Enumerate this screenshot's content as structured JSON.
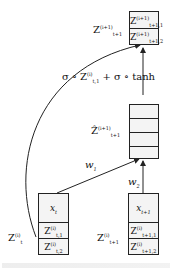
{
  "diagram": {
    "top_node": {
      "label": "Z",
      "label_sup": "(i+1)",
      "label_sub": "t+1",
      "cells": [
        {
          "main": "Z",
          "sup": "(i+1)",
          "sub": "t+1,1"
        },
        {
          "main": "Z",
          "sup": "(i+1)",
          "sub": "t+1,2"
        }
      ]
    },
    "gate_formula": {
      "part1": "σ ∘ Z",
      "part1_sup": "(i)",
      "part1_sub": "t,1",
      "part2": " + σ ∘ tanh"
    },
    "hidden_node": {
      "label": "Ẑ",
      "label_sup": "(i+1)",
      "label_sub": "t+1",
      "cell_count": 4
    },
    "weights": {
      "w1": "w",
      "w1_sub": "1",
      "w2": "w",
      "w2_sub": "2"
    },
    "left_node": {
      "side_label": "Z",
      "side_sup": "(i)",
      "side_sub": "t",
      "input": {
        "main": "x",
        "sub": "t"
      },
      "cells": [
        {
          "main": "Z",
          "sup": "(i)",
          "sub": "t,1"
        },
        {
          "main": "Z",
          "sup": "(i)",
          "sub": "t,2"
        }
      ]
    },
    "right_node": {
      "side_label": "Z",
      "side_sup": "(i)",
      "side_sub": "t+1",
      "input": {
        "main": "x",
        "sub": "t+1"
      },
      "cells": [
        {
          "main": "Z",
          "sup": "(i)",
          "sub": "t+1,1"
        },
        {
          "main": "Z",
          "sup": "(i)",
          "sub": "t+1,2"
        }
      ]
    },
    "colors": {
      "stroke": "#222222",
      "cell_bg": "#f4f4f4"
    }
  }
}
